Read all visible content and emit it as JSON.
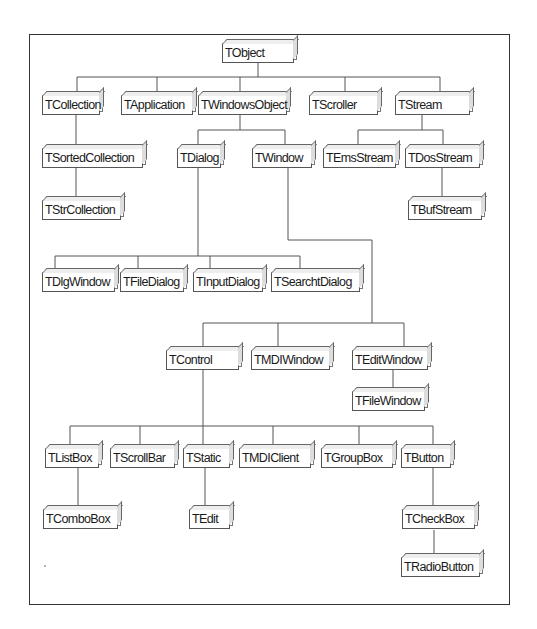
{
  "diagram": {
    "type": "class-hierarchy-tree",
    "root": "TObject",
    "nodes": [
      {
        "id": "TObject",
        "label": "TObject",
        "parent": null,
        "x": 222,
        "y": 43,
        "w": 72
      },
      {
        "id": "TCollection",
        "label": "TCollection",
        "parent": "TObject",
        "x": 42,
        "y": 95,
        "w": 58
      },
      {
        "id": "TApplication",
        "label": "TApplication",
        "parent": "TObject",
        "x": 121,
        "y": 95,
        "w": 72
      },
      {
        "id": "TWindowsObject",
        "label": "TWindowsObject",
        "parent": "TObject",
        "x": 198,
        "y": 95,
        "w": 89
      },
      {
        "id": "TScroller",
        "label": "TScroller",
        "parent": "TObject",
        "x": 309,
        "y": 95,
        "w": 69
      },
      {
        "id": "TStream",
        "label": "TStream",
        "parent": "TObject",
        "x": 395,
        "y": 95,
        "w": 75
      },
      {
        "id": "TSortedCollection",
        "label": "TSortedCollection",
        "parent": "TCollection",
        "x": 42,
        "y": 148,
        "w": 101
      },
      {
        "id": "TDialog",
        "label": "TDialog",
        "parent": "TWindowsObject",
        "x": 177,
        "y": 148,
        "w": 44
      },
      {
        "id": "TWindow",
        "label": "TWindow",
        "parent": "TWindowsObject",
        "x": 252,
        "y": 148,
        "w": 60
      },
      {
        "id": "TEmsStream",
        "label": "TEmsStream",
        "parent": "TStream",
        "x": 323,
        "y": 148,
        "w": 73
      },
      {
        "id": "TDosStream",
        "label": "TDosStream",
        "parent": "TStream",
        "x": 405,
        "y": 148,
        "w": 75
      },
      {
        "id": "TStrCollection",
        "label": "TStrCollection",
        "parent": "TSortedCollection",
        "x": 42,
        "y": 200,
        "w": 79
      },
      {
        "id": "TBufStream",
        "label": "TBufStream",
        "parent": "TDosStream",
        "x": 408,
        "y": 200,
        "w": 74
      },
      {
        "id": "TDlgWindow",
        "label": "TDlgWindow",
        "parent": "TDialog",
        "x": 42,
        "y": 272,
        "w": 73
      },
      {
        "id": "TFileDialog",
        "label": "TFileDialog",
        "parent": "TDialog",
        "x": 120,
        "y": 272,
        "w": 64
      },
      {
        "id": "TInputDialog",
        "label": "TInputDialog",
        "parent": "TDialog",
        "x": 193,
        "y": 272,
        "w": 70
      },
      {
        "id": "TSearchtDialog",
        "label": "TSearchtDialog",
        "parent": "TDialog",
        "x": 271,
        "y": 272,
        "w": 89
      },
      {
        "id": "TControl",
        "label": "TControl",
        "parent": "TWindow",
        "x": 166,
        "y": 350,
        "w": 73
      },
      {
        "id": "TMDIWindow",
        "label": "TMDIWindow",
        "parent": "TWindow",
        "x": 251,
        "y": 350,
        "w": 79
      },
      {
        "id": "TEditWindow",
        "label": "TEditWindow",
        "parent": "TWindow",
        "x": 352,
        "y": 350,
        "w": 76
      },
      {
        "id": "TFileWindow",
        "label": "TFileWindow",
        "parent": "TEditWindow",
        "x": 352,
        "y": 391,
        "w": 73
      },
      {
        "id": "TListBox",
        "label": "TListBox",
        "parent": "TControl",
        "x": 45,
        "y": 448,
        "w": 54
      },
      {
        "id": "TScrollBar",
        "label": "TScrollBar",
        "parent": "TControl",
        "x": 110,
        "y": 448,
        "w": 65
      },
      {
        "id": "TStatic",
        "label": "TStatic",
        "parent": "TControl",
        "x": 183,
        "y": 448,
        "w": 47
      },
      {
        "id": "TMDIClient",
        "label": "TMDIClient",
        "parent": "TControl",
        "x": 239,
        "y": 448,
        "w": 72
      },
      {
        "id": "TGroupBox",
        "label": "TGroupBox",
        "parent": "TControl",
        "x": 321,
        "y": 448,
        "w": 72
      },
      {
        "id": "TButton",
        "label": "TButton",
        "parent": "TControl",
        "x": 401,
        "y": 448,
        "w": 50
      },
      {
        "id": "TComboBox",
        "label": "TComboBox",
        "parent": "TListBox",
        "x": 43,
        "y": 509,
        "w": 75
      },
      {
        "id": "TEdit",
        "label": "TEdit",
        "parent": "TStatic",
        "x": 189,
        "y": 509,
        "w": 41
      },
      {
        "id": "TCheckBox",
        "label": "TCheckBox",
        "parent": "TButton",
        "x": 402,
        "y": 509,
        "w": 73
      },
      {
        "id": "TRadioButton",
        "label": "TRadioButton",
        "parent": "TCheckBox",
        "x": 401,
        "y": 557,
        "w": 79
      }
    ],
    "edges": [
      {
        "points": [
          [
            258,
            63
          ],
          [
            258,
            77
          ]
        ]
      },
      {
        "points": [
          [
            77,
            77
          ],
          [
            440,
            77
          ]
        ]
      },
      {
        "points": [
          [
            77,
            77
          ],
          [
            77,
            95
          ]
        ]
      },
      {
        "points": [
          [
            157,
            77
          ],
          [
            157,
            95
          ]
        ]
      },
      {
        "points": [
          [
            240,
            77
          ],
          [
            240,
            95
          ]
        ]
      },
      {
        "points": [
          [
            345,
            77
          ],
          [
            345,
            95
          ]
        ]
      },
      {
        "points": [
          [
            440,
            77
          ],
          [
            440,
            95
          ]
        ]
      },
      {
        "points": [
          [
            76,
            115
          ],
          [
            76,
            148
          ]
        ]
      },
      {
        "points": [
          [
            76,
            168
          ],
          [
            76,
            200
          ]
        ]
      },
      {
        "points": [
          [
            240,
            115
          ],
          [
            240,
            130
          ]
        ]
      },
      {
        "points": [
          [
            198,
            130
          ],
          [
            285,
            130
          ]
        ]
      },
      {
        "points": [
          [
            198,
            130
          ],
          [
            198,
            148
          ]
        ]
      },
      {
        "points": [
          [
            285,
            130
          ],
          [
            285,
            148
          ]
        ]
      },
      {
        "points": [
          [
            422,
            115
          ],
          [
            422,
            130
          ]
        ]
      },
      {
        "points": [
          [
            358,
            130
          ],
          [
            443,
            130
          ]
        ]
      },
      {
        "points": [
          [
            358,
            130
          ],
          [
            358,
            148
          ]
        ]
      },
      {
        "points": [
          [
            443,
            130
          ],
          [
            443,
            148
          ]
        ]
      },
      {
        "points": [
          [
            442,
            168
          ],
          [
            442,
            200
          ]
        ]
      },
      {
        "points": [
          [
            198,
            168
          ],
          [
            198,
            256
          ]
        ]
      },
      {
        "points": [
          [
            55,
            256
          ],
          [
            300,
            256
          ]
        ]
      },
      {
        "points": [
          [
            55,
            256
          ],
          [
            55,
            272
          ]
        ]
      },
      {
        "points": [
          [
            138,
            256
          ],
          [
            138,
            272
          ]
        ]
      },
      {
        "points": [
          [
            210,
            256
          ],
          [
            210,
            272
          ]
        ]
      },
      {
        "points": [
          [
            300,
            256
          ],
          [
            300,
            272
          ]
        ]
      },
      {
        "points": [
          [
            288,
            168
          ],
          [
            288,
            240
          ],
          [
            372,
            240
          ],
          [
            372,
            323
          ]
        ]
      },
      {
        "points": [
          [
            203,
            323
          ],
          [
            404,
            323
          ]
        ]
      },
      {
        "points": [
          [
            203,
            323
          ],
          [
            203,
            350
          ]
        ]
      },
      {
        "points": [
          [
            278,
            323
          ],
          [
            278,
            350
          ]
        ]
      },
      {
        "points": [
          [
            404,
            323
          ],
          [
            404,
            350
          ]
        ]
      },
      {
        "points": [
          [
            393,
            370
          ],
          [
            393,
            391
          ]
        ]
      },
      {
        "points": [
          [
            203,
            370
          ],
          [
            203,
            426
          ]
        ]
      },
      {
        "points": [
          [
            70,
            426
          ],
          [
            433,
            426
          ]
        ]
      },
      {
        "points": [
          [
            70,
            426
          ],
          [
            70,
            448
          ]
        ]
      },
      {
        "points": [
          [
            140,
            426
          ],
          [
            140,
            448
          ]
        ]
      },
      {
        "points": [
          [
            203,
            426
          ],
          [
            203,
            448
          ]
        ]
      },
      {
        "points": [
          [
            273,
            426
          ],
          [
            273,
            448
          ]
        ]
      },
      {
        "points": [
          [
            359,
            426
          ],
          [
            359,
            448
          ]
        ]
      },
      {
        "points": [
          [
            433,
            426
          ],
          [
            433,
            448
          ]
        ]
      },
      {
        "points": [
          [
            78,
            468
          ],
          [
            78,
            509
          ]
        ]
      },
      {
        "points": [
          [
            205,
            468
          ],
          [
            205,
            509
          ]
        ]
      },
      {
        "points": [
          [
            433,
            468
          ],
          [
            433,
            509
          ]
        ]
      },
      {
        "points": [
          [
            434,
            530
          ],
          [
            434,
            557
          ]
        ]
      }
    ]
  }
}
